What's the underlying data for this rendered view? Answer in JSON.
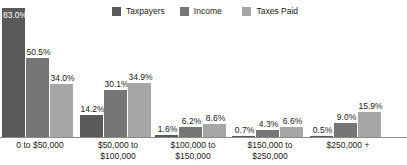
{
  "chart_data": {
    "type": "bar",
    "title": "",
    "subtitle": "",
    "xlabel": "",
    "ylabel": "",
    "ylim": [
      0,
      100
    ],
    "grid": false,
    "legend_position": "top",
    "value_suffix": "%",
    "categories": [
      "0 to $50,000",
      "$50,000 to\n$100,000",
      "$100,000 to\n$150,000",
      "$150,000 to\n$250,000",
      "$250,000 +"
    ],
    "series": [
      {
        "name": "Taxpayers",
        "color": "#595959",
        "values": [
          83.0,
          14.2,
          1.6,
          0.7,
          0.5
        ]
      },
      {
        "name": "Income",
        "color": "#767676",
        "values": [
          50.5,
          30.1,
          6.2,
          4.3,
          9.0
        ]
      },
      {
        "name": "Taxes Paid",
        "color": "#a6a6a6",
        "values": [
          34.0,
          34.9,
          8.6,
          6.6,
          15.9
        ]
      }
    ]
  },
  "legend": {
    "items": [
      {
        "label": "Taxpayers",
        "color": "#595959"
      },
      {
        "label": "Income",
        "color": "#767676"
      },
      {
        "label": "Taxes Paid",
        "color": "#a6a6a6"
      }
    ]
  },
  "axis": {
    "categories": [
      {
        "line1": "0 to $50,000",
        "line2": ""
      },
      {
        "line1": "$50,000 to",
        "line2": "$100,000"
      },
      {
        "line1": "$100,000 to",
        "line2": "$150,000"
      },
      {
        "line1": "$150,000 to",
        "line2": "$250,000"
      },
      {
        "line1": "$250,000 +",
        "line2": ""
      }
    ]
  },
  "data_labels": {
    "group0": [
      "83.0%",
      "50.5%",
      "34.0%"
    ],
    "group1": [
      "14.2%",
      "30.1%",
      "34.9%"
    ],
    "group2": [
      "1.6%",
      "6.2%",
      "8.6%"
    ],
    "group3": [
      "0.7%",
      "4.3%",
      "6.6%"
    ],
    "group4": [
      "0.5%",
      "9.0%",
      "15.9%"
    ]
  }
}
